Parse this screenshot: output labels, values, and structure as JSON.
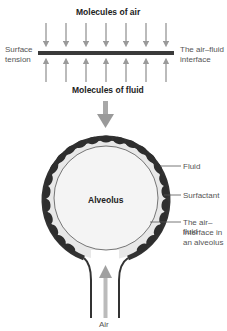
{
  "diagram": {
    "top_panel": {
      "label_air": "Molecules of air",
      "label_fluid": "Molecules of fluid",
      "label_left_line1": "Surface",
      "label_left_line2": "tension",
      "label_right_line1": "The air–fluid",
      "label_right_line2": "interface",
      "arrow_count": 7
    },
    "alveolus": {
      "center_label": "Alveolus",
      "callouts": [
        {
          "text": "Fluid"
        },
        {
          "text": "Surfactant"
        },
        {
          "line1": "The air–fluid",
          "line2": "interface in",
          "line3": "an alveolus"
        }
      ],
      "air_label": "Air"
    },
    "colors": {
      "arrow": "#9a9a9a",
      "interface_bar": "#3a3a3a",
      "surfactant": "#2e2e2e",
      "fluid": "#e6e6e6",
      "text": "#555555"
    }
  }
}
